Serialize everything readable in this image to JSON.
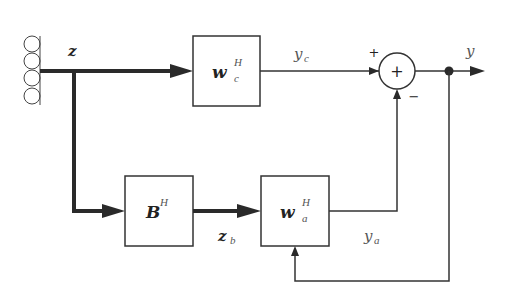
{
  "diagram": {
    "type": "block-diagram",
    "colors": {
      "line": "#2a2a2a",
      "background": "#ffffff",
      "label": "#555555"
    },
    "input": {
      "label": "z",
      "sensor_count": 4
    },
    "blocks": [
      {
        "id": "wc",
        "main": "w",
        "sup": "H",
        "sub": "c"
      },
      {
        "id": "B",
        "main": "B",
        "sup": "H",
        "sub": ""
      },
      {
        "id": "wa",
        "main": "w",
        "sup": "H",
        "sub": "a"
      }
    ],
    "signals": {
      "yc": {
        "main": "y",
        "sub": "c"
      },
      "zb": {
        "main": "z",
        "sub": "b"
      },
      "ya": {
        "main": "y",
        "sub": "a"
      },
      "y": {
        "main": "y"
      }
    },
    "summer": {
      "symbol": "+",
      "plus_sign": "+",
      "minus_sign": "−"
    }
  }
}
